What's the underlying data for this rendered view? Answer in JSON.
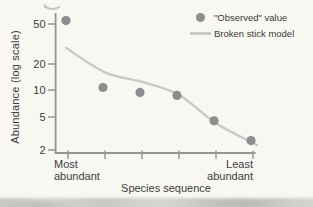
{
  "figure": {
    "y_axis_label": "Abundance (log scale)",
    "x_axis_title": "Species sequence",
    "x_left_line1": "Most",
    "x_left_line2": "abundant",
    "x_right_line1": "Least",
    "x_right_line2": "abundant"
  },
  "legend": {
    "observed_label": "\"Observed\" value",
    "model_label": "Broken stick model"
  },
  "colors": {
    "observed_dot": "#8d8c8e",
    "model_line": "#c9c9c3",
    "axis": "#959591",
    "text": "#3d3d3d",
    "background": "#f8f7f2",
    "page_edge_band": "#cac9c5"
  },
  "chart_data": {
    "type": "scatter",
    "y_scale": "log",
    "ylabel": "Abundance (log scale)",
    "xlabel": "Species sequence",
    "y_ticks": [
      50,
      20,
      10,
      5,
      2
    ],
    "ylim": [
      1.7,
      70
    ],
    "x": [
      1,
      2,
      3,
      4,
      5,
      6
    ],
    "x_tick_count": 6,
    "x_axis_endpoint_labels": [
      "Most abundant",
      "Least abundant"
    ],
    "legend_position": "top-right",
    "grid": false,
    "series": [
      {
        "name": "\"Observed\" value",
        "type": "scatter",
        "values": [
          54,
          10.7,
          9.4,
          8.7,
          4.5,
          2.6
        ]
      },
      {
        "name": "Broken stick model",
        "type": "line",
        "values": [
          29,
          16,
          12.4,
          8.8,
          4.2,
          2.3
        ]
      }
    ]
  }
}
